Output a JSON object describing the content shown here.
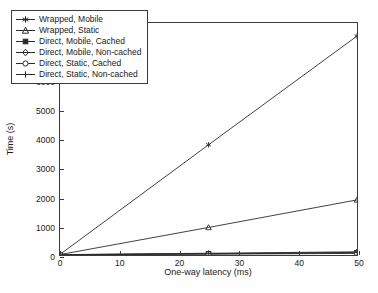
{
  "chart_data": {
    "type": "line",
    "title": "",
    "xlabel": "One-way latency (ms)",
    "ylabel": "Time (s)",
    "xlim": [
      0,
      50
    ],
    "ylim": [
      0,
      8000
    ],
    "xticks": [
      0,
      10,
      20,
      30,
      40,
      50
    ],
    "yticks": [
      0,
      1000,
      2000,
      3000,
      4000,
      5000,
      6000,
      7000,
      8000
    ],
    "xtick_labels": [
      "0",
      "10",
      "20",
      "30",
      "40",
      "50"
    ],
    "ytick_labels": [
      "0",
      "1000",
      "2000",
      "3000",
      "4000",
      "5000",
      "6000",
      "7000",
      "8000"
    ],
    "grid": false,
    "legend_position": "upper left",
    "x": [
      0,
      25,
      50
    ],
    "series": [
      {
        "name": "Wrapped, Mobile",
        "marker": "star-marker",
        "values": [
          20,
          3800,
          7550
        ]
      },
      {
        "name": "Wrapped, Static",
        "marker": "triangle-marker",
        "values": [
          15,
          950,
          1900
        ]
      },
      {
        "name": "Direct, Mobile, Cached",
        "marker": "filled-square-marker",
        "values": [
          10,
          40,
          75
        ]
      },
      {
        "name": "Direct, Mobile, Non-cached",
        "marker": "diamond-marker",
        "values": [
          12,
          60,
          110
        ]
      },
      {
        "name": "Direct, Static, Cached",
        "marker": "open-circle-marker",
        "values": [
          8,
          30,
          55
        ]
      },
      {
        "name": "Direct, Static, Non-cached",
        "marker": "plus-marker",
        "values": [
          10,
          45,
          90
        ]
      }
    ]
  },
  "colors": {
    "axis": "#3c3c3c",
    "series": "#2b2b2b",
    "background": "#ffffff"
  }
}
